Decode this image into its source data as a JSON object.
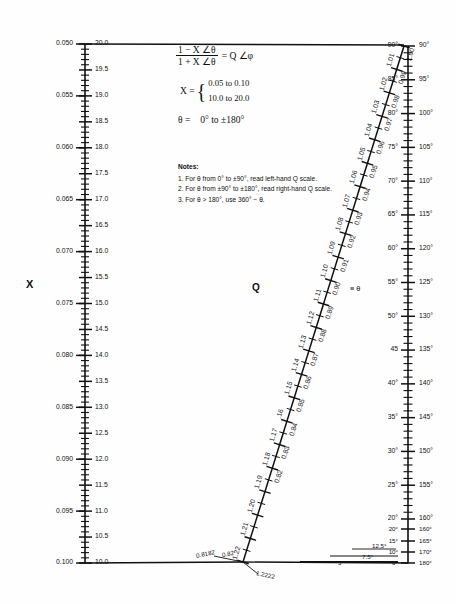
{
  "figure": {
    "type": "nomogram",
    "title_labels": {
      "x_axis_label": "X",
      "q_axis_label": "Q",
      "theta_axis_label": "≡ θ"
    },
    "formula": {
      "numerator": "1 − X ∠θ",
      "denominator": "1 + X ∠θ",
      "equals": "= Q ∠φ",
      "x_label": "X =",
      "x_range_top": "0.05 to 0.10",
      "x_range_bottom": "10.0 to 20.0",
      "theta_label": "θ =",
      "theta_range": "0° to ±180°"
    },
    "notes": {
      "heading": "Notes:",
      "items": [
        "1.  For θ from 0° to ±90°, read left-hand Q scale.",
        "2.  For θ from ±90° to ±180°, read right-hand Q scale.",
        "3.  For θ > 180°, use 360° − θ."
      ]
    }
  },
  "chart_data": {
    "type": "nomogram",
    "scales": [
      {
        "name": "x-scale-left-outer",
        "orientation": "vertical",
        "position": "left",
        "side": "outer",
        "range": [
          0.05,
          0.1
        ],
        "top_value": 0.05,
        "bottom_value": 0.1,
        "major_labels": [
          "0.050",
          "0.055",
          "0.060",
          "0.065",
          "0.070",
          "0.075",
          "0.080",
          "0.085",
          "0.090",
          "0.095",
          "0.100"
        ],
        "minor_ticks_per_major": 5
      },
      {
        "name": "x-scale-left-inner",
        "orientation": "vertical",
        "position": "left",
        "side": "inner",
        "range": [
          20.0,
          10.0
        ],
        "top_value": 20.0,
        "bottom_value": 10.0,
        "major_labels": [
          "20.0",
          "19.5",
          "19.0",
          "18.5",
          "18.0",
          "17.5",
          "17.0",
          "16.5",
          "16.0",
          "15.5",
          "15.0",
          "14.5",
          "14.0",
          "13.5",
          "13.0",
          "12.5",
          "12.0",
          "11.5",
          "11.0",
          "10.5",
          "10.0"
        ],
        "minor_ticks_per_major": 5
      },
      {
        "name": "q-scale-diagonal-left",
        "orientation": "diagonal",
        "position": "center",
        "side": "left",
        "range": [
          1.0,
          0.82
        ],
        "major_labels": [
          "1.00",
          "0.99",
          "0.98",
          "0.97",
          "0.96",
          "0.95",
          "0.94",
          "0.93",
          "0.92",
          "0.91",
          "0.90",
          "0.89",
          "0.88",
          "0.87",
          "0.86",
          "0.85",
          "0.84",
          "0.83",
          "0.82"
        ],
        "end_label": "0.8182",
        "minor_ticks_per_major": 2
      },
      {
        "name": "q-scale-diagonal-right",
        "orientation": "diagonal",
        "position": "center",
        "side": "right",
        "range": [
          1.0,
          1.22
        ],
        "major_labels": [
          "1.01",
          "1.02",
          "1.03",
          "1.04",
          "1.05",
          "1.06",
          "1.07",
          "1.08",
          "1.09",
          "1.10",
          "1.11",
          "1.12",
          "1.13",
          "1.14",
          "1.15",
          ".16",
          "1.17",
          "1.18",
          "1.19",
          "1.20",
          "1.21",
          "1.22"
        ],
        "end_label": "1.2222",
        "minor_ticks_per_major": 2
      },
      {
        "name": "theta-scale-right-left-side",
        "orientation": "vertical",
        "position": "right",
        "side": "left",
        "range": [
          90,
          0
        ],
        "major_labels": [
          "90°",
          "85°",
          "80°",
          "75°",
          "70°",
          "65°",
          "60°",
          "55°",
          "50°",
          "45",
          "40°",
          "35°",
          "30°",
          "25°",
          "20°",
          "15°",
          "12.5°",
          "10°",
          "7.5°",
          "5°",
          "0°"
        ],
        "minor_ticks_per_major": 5
      },
      {
        "name": "theta-scale-right-right-side",
        "orientation": "vertical",
        "position": "right",
        "side": "right",
        "range": [
          90,
          180
        ],
        "major_labels": [
          "90°",
          "95°",
          "100°",
          "105°",
          "110°",
          "115°",
          "120°",
          "125°",
          "130°",
          "135°",
          "140°",
          "145°",
          "150°",
          "155°",
          "160°",
          "165°",
          "170°",
          "180°"
        ],
        "minor_ticks_per_major": 5
      }
    ],
    "xlabel": "X",
    "ylabel": "",
    "grid": false,
    "legend": "none"
  },
  "x_scale": {
    "major": [
      {
        "outer": "0.050",
        "inner": "20.0",
        "y": 44
      },
      {
        "outer": "0.055",
        "inner": "19.5",
        "y": 71
      },
      {
        "outer": "0.060",
        "inner": "19.0",
        "y": 98
      },
      {
        "outer": "0.065",
        "inner": "18.5",
        "y": 125
      },
      {
        "outer": "0.070",
        "inner": "18.0",
        "y": 152
      },
      {
        "outer": "0.075",
        "inner": "17.5",
        "y": 179
      },
      {
        "outer": "0.080",
        "inner": "17.0",
        "y": 206
      },
      {
        "outer": "0.085",
        "inner": "16.5",
        "y": 233
      },
      {
        "outer": "0.090",
        "inner": "16.0",
        "y": 260
      },
      {
        "outer": "0.095",
        "inner": "15.5",
        "y": 287
      },
      {
        "outer": "0.100",
        "inner": "15.0",
        "y": 314
      }
    ],
    "outer_labels": [
      "0.050",
      "0.055",
      "0.060",
      "0.065",
      "0.070",
      "0.075",
      "0.080",
      "0.085",
      "0.090",
      "0.095",
      "0.100"
    ],
    "inner_labels": [
      "20.0",
      "19.5",
      "19.0",
      "18.5",
      "18.0",
      "17.5",
      "17.0",
      "16.5",
      "16.0",
      "15.5",
      "15.0",
      "14.5",
      "14.0",
      "13.5",
      "13.0",
      "12.5",
      "12.0",
      "11.5",
      "11.0",
      "10.5",
      "10.0"
    ]
  },
  "theta_scale": {
    "left_labels": [
      "90°",
      "85°",
      "80°",
      "75°",
      "70°",
      "65°",
      "60°",
      "55°",
      "50°",
      "45",
      "40°",
      "35°",
      "30°",
      "25°",
      "20°",
      "15°",
      "10°",
      "0°"
    ],
    "right_labels": [
      "90°",
      "95°",
      "100°",
      "105°",
      "110°",
      "115°",
      "120°",
      "125°",
      "130°",
      "135°",
      "140°",
      "145°",
      "150°",
      "155°",
      "160°",
      "165°",
      "170°",
      "180°"
    ],
    "extra_left": [
      "12.5°",
      "7.5°",
      "5°"
    ]
  },
  "q_scale": {
    "left_labels": [
      "1.00",
      "0.99",
      "0.98",
      "0.97",
      "0.96",
      "0.95",
      "0.94",
      "0.93",
      "0.92",
      "0.91",
      "0.90",
      "0.89",
      "0.88",
      "0.87",
      "0.86",
      "0.85",
      "0.84",
      "0.83",
      "0.82"
    ],
    "right_labels": [
      "1.01",
      "1.02",
      "1.03",
      "1.04",
      "1.05",
      "1.06",
      "1.07",
      "1.08",
      "1.09",
      "1.10",
      "1.11",
      "1.12",
      "1.13",
      "1.14",
      "1.15",
      ".16",
      "1.17",
      "1.18",
      "1.19",
      "1.20",
      "1.21",
      "1.22"
    ],
    "end_left": "0.8182",
    "end_right": "1.2222"
  }
}
